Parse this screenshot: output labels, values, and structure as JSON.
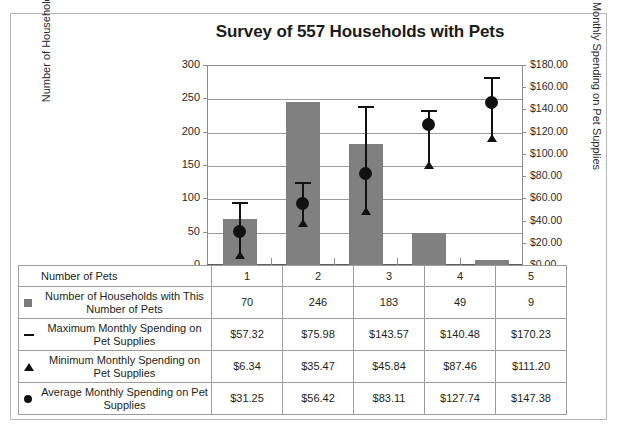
{
  "chart_data": {
    "type": "bar",
    "title": "Survey of 557 Households with Pets",
    "xlabel": "Number of Pets",
    "ylabel": "Number of Households",
    "y2label": "Monthly Spending on Pet Supplies",
    "categories": [
      "1",
      "2",
      "3",
      "4",
      "5"
    ],
    "ylim": [
      0,
      300
    ],
    "y2lim": [
      0,
      180
    ],
    "yticks": [
      "0",
      "50",
      "100",
      "150",
      "200",
      "250",
      "300"
    ],
    "y2ticks": [
      "$0.00",
      "$20.00",
      "$40.00",
      "$60.00",
      "$80.00",
      "$100.00",
      "$120.00",
      "$140.00",
      "$160.00",
      "$180.00"
    ],
    "grid": true,
    "legend_position": "table",
    "series": [
      {
        "name": "Number of Households with This Number of Pets",
        "marker": "square",
        "axis": "left",
        "values": [
          70,
          246,
          183,
          49,
          9
        ]
      },
      {
        "name": "Maximum Monthly Spending on Pet Supplies",
        "marker": "dash",
        "axis": "right",
        "values": [
          57.32,
          75.98,
          143.57,
          140.48,
          170.23
        ]
      },
      {
        "name": "Minimum Monthly Spending on Pet Supplies",
        "marker": "triangle",
        "axis": "right",
        "values": [
          6.34,
          35.47,
          45.84,
          87.46,
          111.2
        ]
      },
      {
        "name": "Average Monthly Spending on Pet Supplies",
        "marker": "circle",
        "axis": "right",
        "values": [
          31.25,
          56.42,
          83.11,
          127.74,
          147.38
        ]
      }
    ]
  },
  "table": {
    "header_label": "Number of Pets",
    "header_values": [
      "1",
      "2",
      "3",
      "4",
      "5"
    ],
    "rows": [
      {
        "marker": "square",
        "label": "Number of Households with This Number of Pets",
        "values": [
          "70",
          "246",
          "183",
          "49",
          "9"
        ]
      },
      {
        "marker": "dash",
        "label": "Maximum Monthly Spending on Pet Supplies",
        "values": [
          "$57.32",
          "$75.98",
          "$143.57",
          "$140.48",
          "$170.23"
        ]
      },
      {
        "marker": "triangle",
        "label": "Minimum Monthly Spending on Pet Supplies",
        "values": [
          "$6.34",
          "$35.47",
          "$45.84",
          "$87.46",
          "$111.20"
        ]
      },
      {
        "marker": "circle",
        "label": "Average Monthly Spending on Pet Supplies",
        "values": [
          "$31.25",
          "$56.42",
          "$83.11",
          "$127.74",
          "$147.38"
        ]
      }
    ]
  },
  "colors": {
    "bar_fill": "#808080",
    "marker": "#111111",
    "grid": "#9b9b9b",
    "border": "#9d9d9d",
    "text": "#231f20"
  }
}
